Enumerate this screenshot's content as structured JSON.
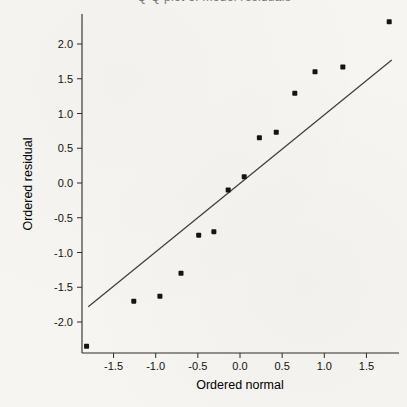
{
  "figure": {
    "title_clipped_text": "Q-Q plot of model residuals"
  },
  "chart_data": {
    "type": "scatter",
    "title": "Q-Q plot of model residuals",
    "subtitle": "",
    "xlabel": "Ordered normal",
    "ylabel": "Ordered residual",
    "xlim": [
      -1.89,
      1.9
    ],
    "ylim": [
      -2.45,
      2.43
    ],
    "x_tick_values": [
      -1.5,
      -1.0,
      -0.5,
      0.0,
      0.5,
      1.0,
      1.5
    ],
    "x_tick_labels": [
      "-1.5",
      "-1.0",
      "-0.5",
      "0.0",
      "0.5",
      "1.0",
      "1.5"
    ],
    "y_tick_values": [
      -2.0,
      -1.5,
      -1.0,
      -0.5,
      0.0,
      0.5,
      1.0,
      1.5,
      2.0
    ],
    "y_tick_labels": [
      "-2.0",
      "-1.5",
      "-1.0",
      "-0.5",
      "0.0",
      "0.5",
      "1.0",
      "1.5",
      "2.0"
    ],
    "grid": false,
    "legend": "none",
    "marker": "small-black-square",
    "axes_style": "left-and-bottom-only",
    "points": [
      {
        "x": -1.82,
        "y": -2.35
      },
      {
        "x": -1.26,
        "y": -1.7
      },
      {
        "x": -0.95,
        "y": -1.63
      },
      {
        "x": -0.7,
        "y": -1.3
      },
      {
        "x": -0.49,
        "y": -0.75
      },
      {
        "x": -0.31,
        "y": -0.7
      },
      {
        "x": -0.14,
        "y": -0.1
      },
      {
        "x": 0.05,
        "y": 0.09
      },
      {
        "x": 0.23,
        "y": 0.65
      },
      {
        "x": 0.43,
        "y": 0.73
      },
      {
        "x": 0.65,
        "y": 1.29
      },
      {
        "x": 0.89,
        "y": 1.6
      },
      {
        "x": 1.22,
        "y": 1.67
      },
      {
        "x": 1.77,
        "y": 2.32
      }
    ],
    "reference_line": {
      "x1": -1.8,
      "y1": -1.78,
      "x2": 1.8,
      "y2": 1.77
    }
  },
  "colors": {
    "background": "#f6f5f2",
    "axis": "#2b2b2b",
    "tick_text": "#111111",
    "reference_line": "#3c3c3c",
    "marker": "#141414",
    "clipped_title": "#777777"
  }
}
